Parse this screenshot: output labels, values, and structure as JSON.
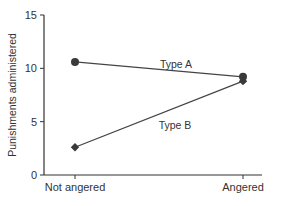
{
  "chart_data": {
    "type": "line",
    "title": "",
    "xlabel": "",
    "ylabel": "Punishments administered",
    "categories": [
      "Not angered",
      "Angered"
    ],
    "series": [
      {
        "name": "Type A",
        "marker": "circle",
        "values": [
          10.6,
          9.2
        ]
      },
      {
        "name": "Type B",
        "marker": "diamond",
        "values": [
          2.6,
          8.8
        ]
      }
    ],
    "ylim": [
      0,
      15
    ],
    "yticks": [
      0,
      5,
      10,
      15
    ],
    "ytick_labels": [
      "0",
      "5",
      "10",
      "15"
    ],
    "grid": false,
    "legend": "inline labels on lines",
    "annotations": [
      {
        "text": "Type A",
        "position": "above Type A line near center"
      },
      {
        "text": "Type B",
        "position": "below Type B line near center"
      }
    ]
  },
  "colors": {
    "line": "#444444",
    "marker": "#3a3a3a",
    "axis": "#333333",
    "text": "#333333"
  }
}
